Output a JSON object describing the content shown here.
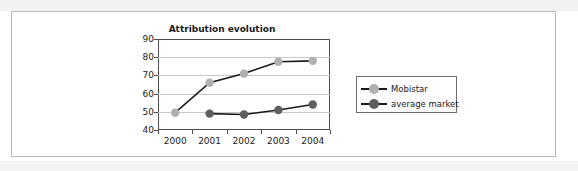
{
  "page": {
    "clipped_caption": "",
    "frame_border_color": "#b9b9b9",
    "background": "#ffffff"
  },
  "chart_data": {
    "type": "line",
    "title": "Attribution evolution",
    "xlabel": "",
    "ylabel": "",
    "categories": [
      "2000",
      "2001",
      "2002",
      "2003",
      "2004"
    ],
    "ylim": [
      40,
      90
    ],
    "yticks": [
      40,
      50,
      60,
      70,
      80,
      90
    ],
    "grid": true,
    "legend_position": "right",
    "series": [
      {
        "name": "Mobistar",
        "color": "#b0b0b0",
        "line_color": "#1a1a1a",
        "marker": "circle",
        "x": [
          "2000",
          "2001",
          "2002",
          "2003",
          "2004"
        ],
        "values": [
          49.5,
          66,
          71,
          77.5,
          78
        ]
      },
      {
        "name": "average market",
        "color": "#5e5e5e",
        "line_color": "#1a1a1a",
        "marker": "circle",
        "x": [
          "2001",
          "2002",
          "2003",
          "2004"
        ],
        "values": [
          49,
          48.5,
          51,
          54
        ]
      }
    ]
  },
  "legend": {
    "items": [
      {
        "label": "Mobistar"
      },
      {
        "label": "average market"
      }
    ]
  }
}
